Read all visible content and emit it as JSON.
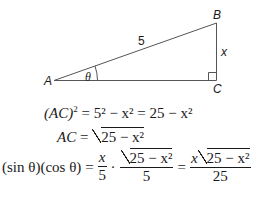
{
  "diagram": {
    "type": "right-triangle",
    "vertices": {
      "A": "A",
      "B": "B",
      "C": "C"
    },
    "hypotenuse_label": "5",
    "opposite_label": "x",
    "angle_label": "θ",
    "right_angle_at": "C",
    "line_color": "#555555"
  },
  "equations": {
    "line1": {
      "lhs": "(AC)",
      "lhs_exp": "2",
      "rhs": "= 5² − x² = 25 − x²"
    },
    "line2": {
      "lhs": "AC",
      "eq": "=",
      "radicand": "25 − x²"
    },
    "line3": {
      "lhs": "(sin θ)(cos θ)",
      "eq1": "=",
      "frac1_num": "x",
      "frac1_den": "5",
      "dot": "·",
      "frac2_num": "25 − x²",
      "frac2_den": "5",
      "eq2": "=",
      "frac3_num_x": "x",
      "frac3_num_rad": "25 − x²",
      "frac3_den": "25"
    }
  }
}
